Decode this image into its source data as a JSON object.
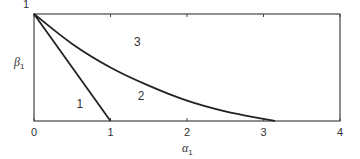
{
  "chart_data": {
    "type": "line",
    "title": "",
    "xlabel": "α",
    "xlabel_sub": "1",
    "ylabel": "β",
    "ylabel_sub": "1",
    "xlim": [
      0,
      4
    ],
    "ylim": [
      0,
      1
    ],
    "xticks": [
      0,
      1,
      2,
      3,
      4
    ],
    "xtick_labels": [
      "0",
      "1",
      "2",
      "3",
      "4"
    ],
    "yticks": [
      1
    ],
    "ytick_labels": [
      "1"
    ],
    "grid": false,
    "series": [
      {
        "name": "linear-boundary",
        "x": [
          0,
          1
        ],
        "y": [
          1,
          0
        ]
      },
      {
        "name": "curved-boundary",
        "x": [
          0,
          0.5,
          1,
          1.5,
          2,
          2.5,
          3,
          3.15
        ],
        "y": [
          1,
          0.72,
          0.5,
          0.33,
          0.19,
          0.09,
          0.02,
          0
        ]
      }
    ],
    "annotations": [
      {
        "text": "1",
        "x": 0.6,
        "y": 0.12
      },
      {
        "text": "2",
        "x": 1.4,
        "y": 0.2
      },
      {
        "text": "3",
        "x": 1.35,
        "y": 0.7
      }
    ]
  }
}
